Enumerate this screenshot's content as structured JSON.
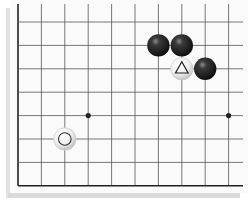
{
  "board": {
    "type": "go-board-fragment",
    "edges_shown": [
      "left",
      "bottom"
    ],
    "columns": 10,
    "rows": 8,
    "colors": {
      "background": "#fafafa",
      "grid_line": "#555555",
      "edge_line": "#222222",
      "shadow": "#d8d8d8",
      "black_stone": "#1a1a1a",
      "white_stone": "#f2f2f2"
    },
    "star_points": [
      {
        "col": 3,
        "row": 4
      },
      {
        "col": 9,
        "row": 4
      }
    ],
    "stones": [
      {
        "color": "black",
        "col": 6,
        "row": 1,
        "marker": null
      },
      {
        "color": "black",
        "col": 7,
        "row": 1,
        "marker": null
      },
      {
        "color": "white",
        "col": 7,
        "row": 2,
        "marker": "triangle"
      },
      {
        "color": "black",
        "col": 8,
        "row": 2,
        "marker": null
      },
      {
        "color": "white",
        "col": 2,
        "row": 5,
        "marker": "circle"
      }
    ]
  }
}
